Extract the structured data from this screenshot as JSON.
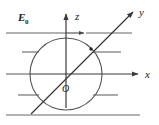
{
  "figure": {
    "background_color": "#ffffff",
    "line_color": "#555555",
    "dark_line_color": "#3a3a3a",
    "text_color": "#1a1a1a",
    "width": 159,
    "height": 125
  },
  "labels": {
    "field": "E",
    "field_subscript": "0",
    "axis_x": "x",
    "axis_y": "y",
    "axis_z": "z",
    "origin": "O"
  },
  "geometry": {
    "sphere": {
      "cx": 66,
      "cy": 74,
      "r": 36
    },
    "origin_point": {
      "x": 66,
      "y": 74
    },
    "axis_x": {
      "x1": 66,
      "y1": 74,
      "x2": 140,
      "y2": 74
    },
    "axis_z": {
      "x1": 66,
      "y1": 74,
      "x2": 66,
      "y2": 14
    },
    "axis_y": {
      "x1": 33,
      "y1": 112,
      "x2": 132,
      "y2": 13
    },
    "intersection_y_sphere": {
      "x": 91,
      "y": 49
    }
  },
  "field_lines": {
    "count": 6,
    "y_positions": [
      33,
      52,
      74,
      95,
      115
    ],
    "description": "Horizontal uniform field lines pointing in +x direction, interrupted by the sphere"
  }
}
